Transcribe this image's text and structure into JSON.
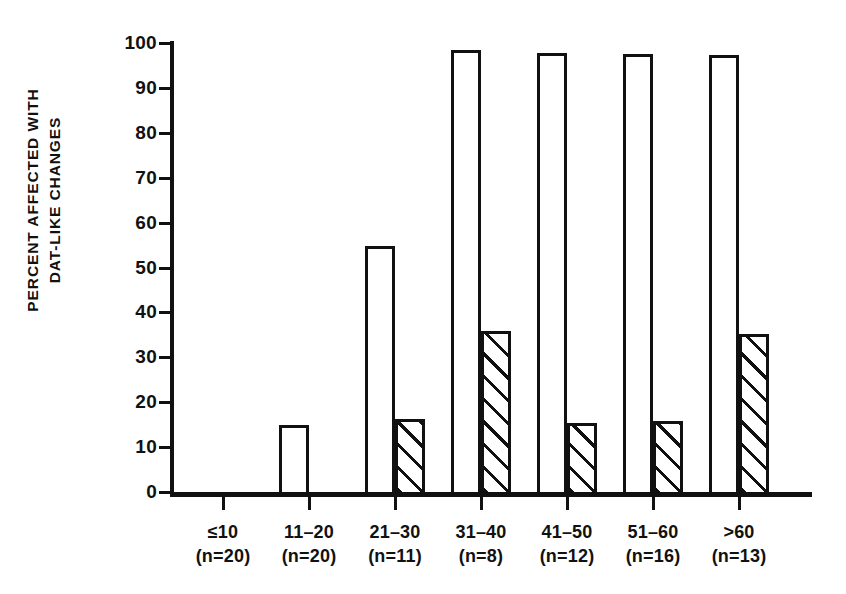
{
  "chart_data": {
    "type": "bar",
    "title": "",
    "subtitle": "",
    "xlabel": "",
    "ylabel": "PERCENT AFFECTED WITH DAT-LIKE CHANGES",
    "ylabel_lines": [
      "PERCENT AFFECTED WITH",
      "DAT-LIKE CHANGES"
    ],
    "ylim": [
      0,
      100
    ],
    "yticks": [
      0,
      10,
      20,
      30,
      40,
      50,
      60,
      70,
      80,
      90,
      100
    ],
    "ytick_labels": [
      "0",
      "10",
      "20",
      "30",
      "40",
      "50",
      "60",
      "70",
      "80",
      "90",
      "100"
    ],
    "grid": false,
    "legend": "none",
    "categories": [
      "≤10",
      "11–20",
      "21–30",
      "31–40",
      "41–50",
      "51–60",
      ">60"
    ],
    "category_sublabels": [
      "(n=20)",
      "(n=20)",
      "(n=11)",
      "(n=8)",
      "(n=12)",
      "(n=16)",
      "(n=13)"
    ],
    "category_n": [
      20,
      20,
      11,
      8,
      12,
      16,
      13
    ],
    "series": [
      {
        "name": "open",
        "style": "open",
        "values": [
          0,
          15.6,
          55.5,
          99.0,
          98.5,
          98.3,
          98.0
        ]
      },
      {
        "name": "hatched",
        "style": "diagonal-hatch",
        "values": [
          0,
          0,
          17.0,
          36.5,
          16.0,
          16.5,
          35.8
        ]
      }
    ],
    "colors": {
      "ink": "#111111",
      "background": "#ffffff"
    }
  }
}
